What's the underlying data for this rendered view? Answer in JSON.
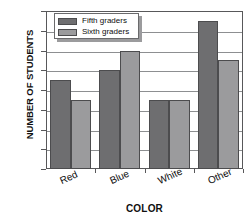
{
  "chart_data": {
    "type": "bar",
    "title": "",
    "xlabel": "COLOR",
    "ylabel": "NUMBER OF STUDENTS",
    "categories": [
      "Red",
      "Blue",
      "White",
      "Other"
    ],
    "series": [
      {
        "name": "Fifth graders",
        "values": [
          9,
          10,
          7,
          15
        ],
        "color": "#6e6e70"
      },
      {
        "name": "Sixth graders",
        "values": [
          7,
          12,
          7,
          11
        ],
        "color": "#9b9b9d"
      }
    ],
    "ylim": [
      0,
      16
    ],
    "ytick_step": 2,
    "yticks": [
      "16",
      "14",
      "12",
      "10",
      "8",
      "6",
      "4",
      "2",
      "0"
    ],
    "ytick_values": [
      16,
      14,
      12,
      10,
      8,
      6,
      4,
      2,
      0
    ],
    "grid": true,
    "legend_position": "upper-left-inside",
    "xtick_rotation": -24
  },
  "legend": {
    "entries": [
      {
        "label": "Fifth graders"
      },
      {
        "label": "Sixth graders"
      }
    ]
  },
  "axes": {
    "y_title": "NUMBER OF STUDENTS",
    "x_title": "COLOR"
  }
}
